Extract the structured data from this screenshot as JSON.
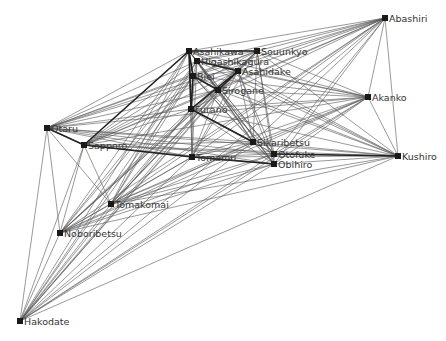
{
  "diagram": {
    "type": "network-graph",
    "nodes": [
      {
        "id": "Asahikawa",
        "label": "Asahikawa",
        "x": 189,
        "y": 51
      },
      {
        "id": "Souunkyo",
        "label": "Souunkyo",
        "x": 257,
        "y": 51
      },
      {
        "id": "Higashikagura",
        "label": "Higashikagura",
        "x": 197,
        "y": 61
      },
      {
        "id": "Biei",
        "label": "Biei",
        "x": 193,
        "y": 76
      },
      {
        "id": "Asahidake",
        "label": "Asahidake",
        "x": 238,
        "y": 71
      },
      {
        "id": "Sirogane",
        "label": "Sirogane",
        "x": 218,
        "y": 90
      },
      {
        "id": "Furano",
        "label": "Furano",
        "x": 191,
        "y": 109
      },
      {
        "id": "Sikaribetsu",
        "label": "Sikaribetsu",
        "x": 253,
        "y": 142
      },
      {
        "id": "Tomamu",
        "label": "Tomamu",
        "x": 192,
        "y": 157
      },
      {
        "id": "Otofuke",
        "label": "Otofuke",
        "x": 274,
        "y": 154
      },
      {
        "id": "Obihiro",
        "label": "Obihiro",
        "x": 274,
        "y": 164
      },
      {
        "id": "Abashiri",
        "label": "Abashiri",
        "x": 385,
        "y": 18
      },
      {
        "id": "Akanko",
        "label": "Akanko",
        "x": 368,
        "y": 97
      },
      {
        "id": "Kushiro",
        "label": "Kushiro",
        "x": 398,
        "y": 156
      },
      {
        "id": "Otaru",
        "label": "Otaru",
        "x": 47,
        "y": 128
      },
      {
        "id": "Sapporo",
        "label": "Sapporo",
        "x": 84,
        "y": 145
      },
      {
        "id": "Tomakomai",
        "label": "Tomakomai",
        "x": 111,
        "y": 204
      },
      {
        "id": "Noboribetsu",
        "label": "Noboribetsu",
        "x": 60,
        "y": 233
      },
      {
        "id": "Hakodate",
        "label": "Hakodate",
        "x": 20,
        "y": 321
      }
    ],
    "strong_edges": [
      [
        "Asahikawa",
        "Souunkyo"
      ],
      [
        "Asahikawa",
        "Furano"
      ],
      [
        "Asahikawa",
        "Sapporo"
      ],
      [
        "Asahikawa",
        "Biei"
      ],
      [
        "Biei",
        "Furano"
      ],
      [
        "Asahidake",
        "Sirogane"
      ],
      [
        "Asahidake",
        "Furano"
      ],
      [
        "Higashikagura",
        "Asahidake"
      ],
      [
        "Sirogane",
        "Biei"
      ],
      [
        "Sapporo",
        "Otaru"
      ],
      [
        "Sapporo",
        "Tomamu"
      ],
      [
        "Tomamu",
        "Obihiro"
      ],
      [
        "Otofuke",
        "Kushiro"
      ],
      [
        "Furano",
        "Sikaribetsu"
      ]
    ],
    "colors": {
      "edge": "#555555",
      "strong_edge": "#222222",
      "node": "#1a1a1a",
      "label": "#333333",
      "background": "#ffffff"
    }
  }
}
